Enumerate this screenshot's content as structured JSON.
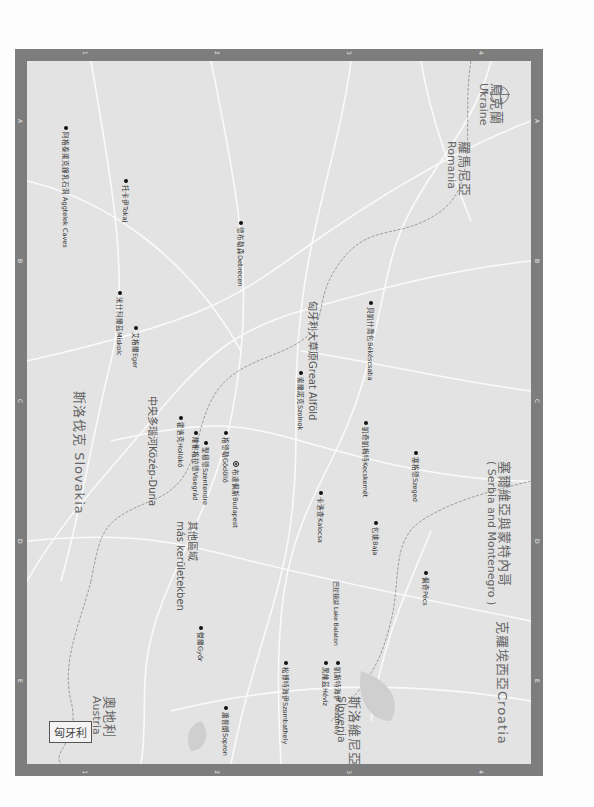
{
  "map": {
    "title": "匈牙利",
    "grid": {
      "columns": [
        "1",
        "2",
        "3",
        "4"
      ],
      "rows": [
        "A",
        "B",
        "C",
        "D",
        "E"
      ]
    },
    "countries": [
      {
        "zh": "烏克蘭",
        "en": "Ukraine"
      },
      {
        "zh": "斯洛伐克",
        "en": "Slovakia"
      },
      {
        "zh": "奧地利",
        "en": "Austria"
      },
      {
        "zh": "斯洛維尼亞",
        "en": "Slovenia"
      },
      {
        "zh": "克羅埃西亞",
        "en": "Croatia"
      },
      {
        "zh": "塞爾維亞與蒙特內哥",
        "en": "( Serbia and Montenegro )"
      },
      {
        "zh": "羅馬尼亞",
        "en": "Romania"
      }
    ],
    "regions": [
      {
        "label": "中央多瑙河Közép-Duna"
      },
      {
        "label": "匈牙利大草原Great Alföld"
      },
      {
        "zh": "其他區域",
        "en": "más kerületekben"
      },
      {
        "label": "巴拉頓湖 Lake Balaton"
      }
    ],
    "cities": [
      {
        "label": "托卡伊Tokaj"
      },
      {
        "label": "阿格泰萊克鐘乳石洞 Aggtelek Caves"
      },
      {
        "label": "德布勒森Debrecen"
      },
      {
        "label": "米什科爾茲Miskolc"
      },
      {
        "label": "艾格爾Eger"
      },
      {
        "label": "霍洛克Hollókő"
      },
      {
        "label": "維榭格拉德Visegrád"
      },
      {
        "label": "聖檀德Szentendre"
      },
      {
        "label": "格德勒Gödöllő"
      },
      {
        "label": "布達佩斯Budapest"
      },
      {
        "label": "索爾諾克Szolnok"
      },
      {
        "label": "貝凱什喬包Békéscsaba"
      },
      {
        "label": "凱奇凱梅特Kecskemét"
      },
      {
        "label": "塞格德Szeged"
      },
      {
        "label": "卡洛查Kalocsa"
      },
      {
        "label": "包姚Baja"
      },
      {
        "label": "佩奇Pécs"
      },
      {
        "label": "傑爾Győr"
      },
      {
        "label": "蕭普朗Sopron"
      },
      {
        "label": "松博特海伊Szombathely"
      },
      {
        "label": "黑維茲Hévíz"
      },
      {
        "label": "凱斯特海伊 Keszthely"
      }
    ],
    "compass": {
      "label": "N"
    }
  }
}
